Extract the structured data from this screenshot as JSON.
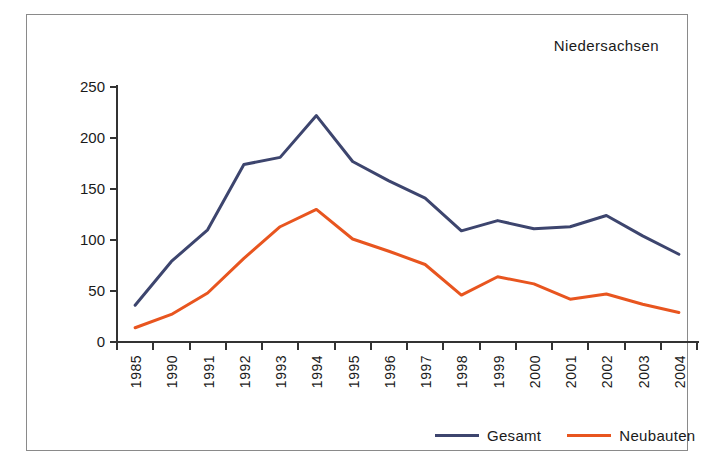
{
  "chart_data": {
    "type": "line",
    "title": "Niedersachsen",
    "xlabel": "",
    "ylabel": "",
    "ylim": [
      0,
      250
    ],
    "ytick_step": 50,
    "yticks": [
      0,
      50,
      100,
      150,
      200,
      250
    ],
    "grid": false,
    "legend_position": "bottom-right",
    "categories": [
      "1985",
      "1990",
      "1991",
      "1992",
      "1993",
      "1994",
      "1995",
      "1996",
      "1997",
      "1998",
      "1999",
      "2000",
      "2001",
      "2002",
      "2003",
      "2004"
    ],
    "series": [
      {
        "name": "Gesamt",
        "color": "#3d456e",
        "values": [
          36,
          79,
          110,
          174,
          181,
          222,
          177,
          158,
          141,
          109,
          119,
          111,
          113,
          124,
          104,
          86
        ]
      },
      {
        "name": "Neubauten",
        "color": "#e8551f",
        "values": [
          14,
          27,
          48,
          82,
          113,
          130,
          101,
          89,
          76,
          46,
          64,
          57,
          42,
          47,
          37,
          29
        ]
      }
    ]
  },
  "chart": {
    "title": "Niedersachsen"
  },
  "legend": {
    "items": [
      {
        "label": "Gesamt",
        "color": "#3d456e"
      },
      {
        "label": "Neubauten",
        "color": "#e8551f"
      }
    ]
  }
}
